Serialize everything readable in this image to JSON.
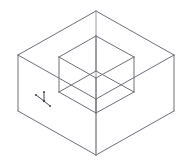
{
  "figure": {
    "title": "",
    "watermark": "...",
    "background_color": "#ffffff",
    "line_color": "#6e6e78",
    "line_color_light": "#9a9aa4",
    "line_width": 1,
    "viewport": {
      "width": 191,
      "height": 166
    },
    "projection": "isometric"
  },
  "geometry": {
    "outer_box": {
      "name": "outer-box",
      "label": "Outer rectangular box",
      "vertices": {
        "top_back": [
          96,
          11
        ],
        "top_left": [
          18,
          55
        ],
        "top_right": [
          174,
          55
        ],
        "top_front": [
          96,
          99
        ],
        "bot_left": [
          18,
          111
        ],
        "bot_right": [
          174,
          111
        ],
        "bot_front": [
          96,
          155
        ]
      },
      "edges": [
        [
          "top_back",
          "top_left"
        ],
        [
          "top_back",
          "top_right"
        ],
        [
          "top_left",
          "top_front"
        ],
        [
          "top_right",
          "top_front"
        ],
        [
          "top_left",
          "bot_left"
        ],
        [
          "top_right",
          "bot_right"
        ],
        [
          "top_front",
          "bot_front"
        ],
        [
          "bot_left",
          "bot_front"
        ],
        [
          "bot_right",
          "bot_front"
        ]
      ]
    },
    "inner_cube": {
      "name": "inner-cube",
      "label": "Inner cube",
      "vertices": {
        "top_back": [
          96,
          36
        ],
        "top_left": [
          59,
          57
        ],
        "top_right": [
          134,
          57
        ],
        "top_front": [
          96,
          78
        ],
        "bot_back": [
          96,
          71
        ],
        "bot_left": [
          59,
          92
        ],
        "bot_right": [
          134,
          92
        ],
        "bot_front": [
          96,
          113
        ]
      },
      "edges": [
        [
          "top_back",
          "top_left"
        ],
        [
          "top_back",
          "top_right"
        ],
        [
          "top_left",
          "top_front"
        ],
        [
          "top_right",
          "top_front"
        ],
        [
          "top_left",
          "bot_left"
        ],
        [
          "top_right",
          "bot_right"
        ],
        [
          "top_front",
          "bot_front"
        ],
        [
          "top_back",
          "bot_back"
        ],
        [
          "bot_back",
          "bot_left"
        ],
        [
          "bot_back",
          "bot_right"
        ],
        [
          "bot_left",
          "bot_front"
        ],
        [
          "bot_right",
          "bot_front"
        ]
      ]
    },
    "center_vertical_axis": {
      "name": "center-axis-line",
      "from": [
        96,
        11
      ],
      "to": [
        96,
        155
      ]
    }
  },
  "axis_indicator": {
    "name": "coordinate-axis-triad",
    "origin": [
      44,
      101
    ],
    "axes": [
      {
        "id": "z",
        "label": "",
        "to": [
          44,
          92
        ]
      },
      {
        "id": "x",
        "label": "",
        "to": [
          36,
          95
        ]
      },
      {
        "id": "y",
        "label": "",
        "to": [
          50,
          106
        ]
      }
    ]
  }
}
